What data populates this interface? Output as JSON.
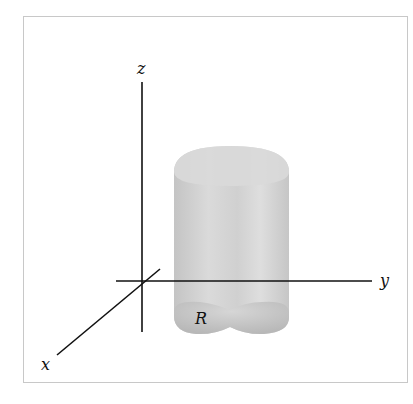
{
  "diagram": {
    "axes": {
      "x_label": "x",
      "y_label": "y",
      "z_label": "z"
    },
    "region_label": "R",
    "solid": "cylinder-like solid over region R in the xy-plane",
    "colors": {
      "axis": "#111111",
      "solid_fill": "#d4d4d4",
      "solid_shade": "#bcbcbc",
      "frame": "#c8c8c8"
    }
  }
}
